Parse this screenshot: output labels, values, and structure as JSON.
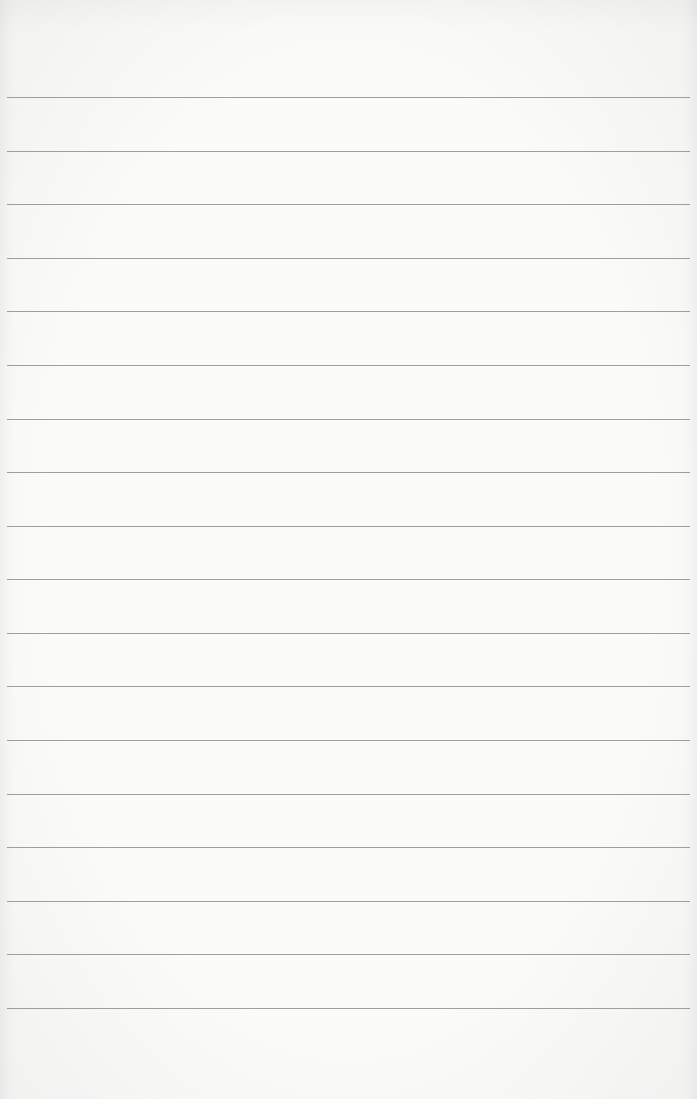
{
  "paper": {
    "type": "lined-paper",
    "background_color": "#fbfbfa",
    "rule_color": "#8e8e8e",
    "rule_count": 18,
    "first_rule_y": 97,
    "last_rule_y": 1008,
    "rule_left_x": 7,
    "rule_right_x": 690
  }
}
